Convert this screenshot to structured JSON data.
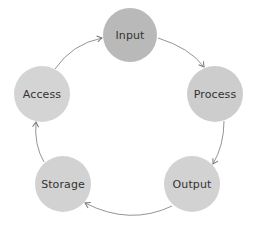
{
  "diagram": {
    "type": "cycle",
    "nodes": [
      {
        "id": "input",
        "label": "Input",
        "cx": 130,
        "cy": 35,
        "r": 27,
        "color": "#b9b9b9"
      },
      {
        "id": "process",
        "label": "Process",
        "cx": 215,
        "cy": 94,
        "r": 28,
        "color": "#cdcdcd"
      },
      {
        "id": "output",
        "label": "Output",
        "cx": 192,
        "cy": 184,
        "r": 28,
        "color": "#d2d2d2"
      },
      {
        "id": "storage",
        "label": "Storage",
        "cx": 63,
        "cy": 184,
        "r": 28,
        "color": "#d2d2d2"
      },
      {
        "id": "access",
        "label": "Access",
        "cx": 42,
        "cy": 94,
        "r": 28,
        "color": "#d4d4d4"
      }
    ],
    "edges": [
      {
        "from": "input",
        "to": "process"
      },
      {
        "from": "process",
        "to": "output"
      },
      {
        "from": "output",
        "to": "storage"
      },
      {
        "from": "storage",
        "to": "access"
      },
      {
        "from": "access",
        "to": "input"
      }
    ],
    "arrow_color": "#777777"
  }
}
